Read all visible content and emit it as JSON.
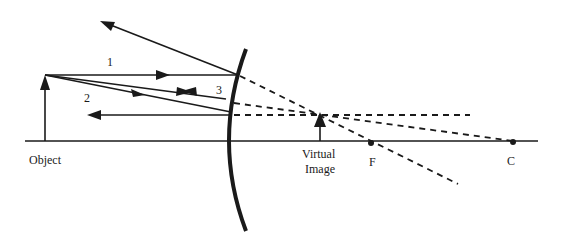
{
  "diagram": {
    "labels": {
      "object": "Object",
      "virtual_image_line1": "Virtual",
      "virtual_image_line2": "Image",
      "focal_point": "F",
      "center_of_curvature": "C",
      "ray1": "1",
      "ray2": "2",
      "ray3": "3"
    },
    "colors": {
      "line": "#1a1a1a",
      "background": "#ffffff"
    }
  }
}
